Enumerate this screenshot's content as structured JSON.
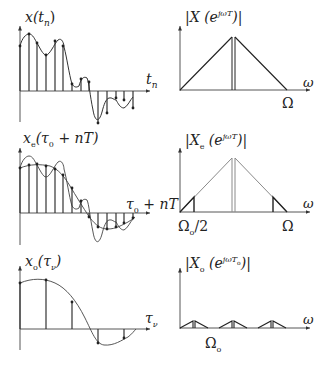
{
  "figure": {
    "rows": [
      {
        "time_panel": {
          "ylabel": "x(tₙ)",
          "xlabel": "tₙ",
          "description": "original signal with dense samples"
        },
        "spectrum_panel": {
          "ylabel": "|X(e^{jωT})|",
          "xlabel": "ω",
          "tick_label": "Ω",
          "description": "triangular spectrum with double line at center"
        }
      },
      {
        "time_panel": {
          "ylabel": "xₑ(τ₀ + nT)",
          "xlabel": "τ₀ + nT",
          "description": "even/lowpass component samples with original signal overlaid"
        },
        "spectrum_panel": {
          "ylabel": "|Xₑ(e^{jωT})|",
          "xlabel": "ω",
          "tick_labels": [
            "Ωₒ/2",
            "Ω"
          ],
          "description": "gray triangular spectrum with bold edge segments"
        }
      },
      {
        "time_panel": {
          "ylabel": "xₒ(τᵥ)",
          "xlabel": "τᵥ",
          "description": "downsampled signal with sparse samples"
        },
        "spectrum_panel": {
          "ylabel": "|Xₒ(e^{jωTₒ})|",
          "xlabel": "ω",
          "tick_label": "Ωₒ",
          "description": "periodic small triangular spectra"
        }
      }
    ]
  },
  "labels": {
    "p1_y": "x(t",
    "p1_y_sub": "n",
    "p1_y_close": ")",
    "p1_x": "t",
    "p1_x_sub": "n",
    "s1_y": "|X (e",
    "s1_y_sup": "jωT",
    "s1_y_close": ")|",
    "s1_x": "ω",
    "s1_tick": "Ω",
    "p2_y": "x",
    "p2_y_sub": "e",
    "p2_y_rest": "(τ",
    "p2_y_sub2": "0",
    "p2_y_rest2": " + nT)",
    "p2_x": "τ",
    "p2_x_sub": "0",
    "p2_x_rest": " + nT",
    "s2_y": "|X",
    "s2_y_sub": "e",
    "s2_y_mid": " (e",
    "s2_y_sup": "jωT",
    "s2_y_close": ")|",
    "s2_x": "ω",
    "s2_tick_left": "Ω",
    "s2_tick_left_sub": "o",
    "s2_tick_left_rest": "/2",
    "s2_tick_right": "Ω",
    "p3_y": "x",
    "p3_y_sub": "o",
    "p3_y_rest": "(τ",
    "p3_y_sub2": "ν",
    "p3_y_close": ")",
    "p3_x": "τ",
    "p3_x_sub": "ν",
    "s3_y": "|X",
    "s3_y_sub": "o",
    "s3_y_mid": " (e",
    "s3_y_sup": "jωT",
    "s3_y_sup_sub": "o",
    "s3_y_close": ")|",
    "s3_x": "ω",
    "s3_tick": "Ω",
    "s3_tick_sub": "o"
  },
  "colors": {
    "ink": "#222222",
    "gray": "#8a8a8a",
    "background": "#ffffff"
  }
}
